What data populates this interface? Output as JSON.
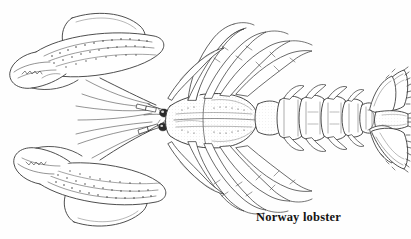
{
  "figure": {
    "kind": "scientific-line-drawing",
    "subject": "Norway lobster",
    "view": "dorsal",
    "orientation": "head and claws at left, tail fan at right",
    "ink_color": "#3a3a3a",
    "shade_color": "#6e6e6e",
    "background_color": "#fefefe"
  },
  "caption": {
    "text": "Norway lobster"
  },
  "anatomy": {
    "parts": [
      {
        "name": "left-chela-upper",
        "label": "upper claw"
      },
      {
        "name": "left-chela-lower",
        "label": "lower claw"
      },
      {
        "name": "carapace",
        "label": "carapace"
      },
      {
        "name": "rostrum",
        "label": "rostrum"
      },
      {
        "name": "eye-upper",
        "label": "eye"
      },
      {
        "name": "eye-lower",
        "label": "eye"
      },
      {
        "name": "antennae",
        "label": "antennae"
      },
      {
        "name": "walking-legs-upper",
        "label": "walking legs"
      },
      {
        "name": "walking-legs-lower",
        "label": "walking legs"
      },
      {
        "name": "abdomen",
        "label": "abdomen"
      },
      {
        "name": "tail-fan",
        "label": "tail fan"
      },
      {
        "name": "telson",
        "label": "telson"
      },
      {
        "name": "uropods",
        "label": "uropods"
      }
    ],
    "abdominal_segment_count": 6,
    "tail_fan_blade_count": 5,
    "walking_leg_pairs": 4
  }
}
